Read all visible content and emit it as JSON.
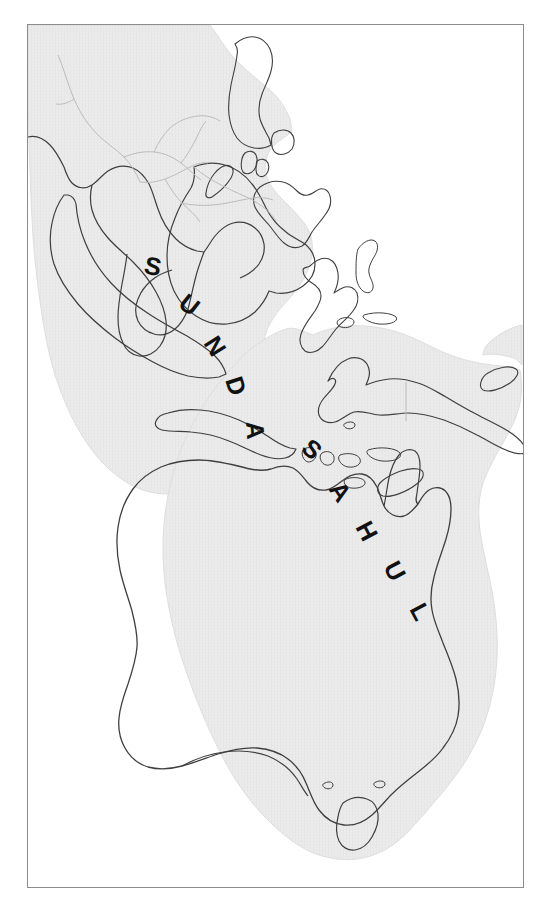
{
  "figure": {
    "name": "sunda-sahul-map",
    "background_color": "#ffffff",
    "frame_color": "#8c8c8c"
  },
  "map": {
    "shelf_fill": "#ebebeb",
    "shelf_edge": "#e0e0e0",
    "coastline_color": "#3a3a3a",
    "border_color": "#b5b5b5",
    "ocean_color": "#ffffff",
    "labels": [
      {
        "id": "sunda",
        "text": "SUNDA",
        "letters": [
          {
            "char": "S",
            "x": 115,
            "y": 248,
            "rotate": 12
          },
          {
            "char": "U",
            "x": 149,
            "y": 281,
            "rotate": 38
          },
          {
            "char": "N",
            "x": 175,
            "y": 318,
            "rotate": 58
          },
          {
            "char": "D",
            "x": 197,
            "y": 355,
            "rotate": 72
          },
          {
            "char": "A",
            "x": 218,
            "y": 397,
            "rotate": 86
          }
        ]
      },
      {
        "id": "sahul",
        "text": "SAHUL",
        "letters": [
          {
            "char": "S",
            "x": 272,
            "y": 425,
            "rotate": 42
          },
          {
            "char": "A",
            "x": 300,
            "y": 464,
            "rotate": 56
          },
          {
            "char": "H",
            "x": 327,
            "y": 502,
            "rotate": 62
          },
          {
            "char": "U",
            "x": 355,
            "y": 542,
            "rotate": 62
          },
          {
            "char": "L",
            "x": 381,
            "y": 584,
            "rotate": 62
          }
        ]
      }
    ],
    "regions": [
      {
        "name": "sunda-shelf",
        "label": "SUNDA"
      },
      {
        "name": "sahul-shelf",
        "label": "SAHUL"
      },
      {
        "name": "wallacea-gap",
        "label": ""
      }
    ]
  }
}
